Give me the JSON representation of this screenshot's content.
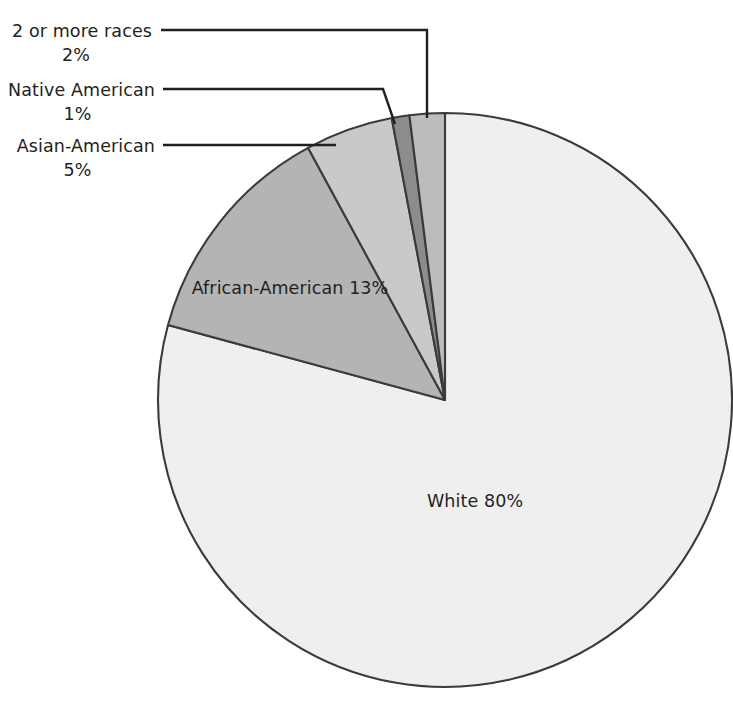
{
  "chart_data": {
    "type": "pie",
    "title": "",
    "categories": [
      "White",
      "African-American",
      "Asian-American",
      "2 or more races",
      "Native American"
    ],
    "values": [
      80,
      13,
      5,
      2,
      1
    ],
    "unit": "%",
    "legend_position": "none",
    "grid": false,
    "slices": [
      {
        "name": "White",
        "label": "White",
        "percent_text": "80%",
        "value": 80,
        "color": "#efefef",
        "label_placement": "inside",
        "inside_text": "White 80%"
      },
      {
        "name": "African-American",
        "label": "African-American",
        "percent_text": "13%",
        "value": 13,
        "color": "#b4b4b4",
        "label_placement": "inside"
      },
      {
        "name": "Asian-American",
        "label": "Asian-American",
        "percent_text": "5%",
        "value": 5,
        "color": "#c9c9c9",
        "label_placement": "callout"
      },
      {
        "name": "Native American",
        "label": "Native American",
        "percent_text": "1%",
        "value": 1,
        "color": "#8c8c8c",
        "label_placement": "callout"
      },
      {
        "name": "2 or more races",
        "label": "2 or more races",
        "percent_text": "2%",
        "value": 2,
        "color": "#bcbcbc",
        "label_placement": "callout"
      }
    ],
    "colors": {
      "outline": "#3b3b3b",
      "leader_line": "#231f20",
      "text": "#231f20",
      "background": "#ffffff"
    }
  },
  "labels": {
    "two_or_more_races": {
      "name": "2 or more races",
      "percent": "2%"
    },
    "native_american": {
      "name": "Native American",
      "percent": "1%"
    },
    "asian_american": {
      "name": "Asian-American",
      "percent": "5%"
    },
    "african_american": {
      "name": "African-American",
      "percent": "13%"
    },
    "white": {
      "text": "White 80%"
    }
  }
}
